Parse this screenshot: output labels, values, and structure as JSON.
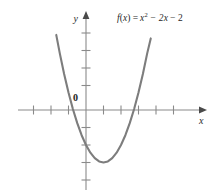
{
  "figure": {
    "title": "",
    "formula": {
      "function_name": "f",
      "argument": "x",
      "equals": "=",
      "term1_base": "x",
      "term1_exp": "2",
      "term2": "− 2x",
      "term3": "− 2",
      "full_text": "f(x) = x2 − 2x − 2"
    },
    "axis_labels": {
      "x": "x",
      "y": "y"
    },
    "origin_label": "0",
    "colors": {
      "curve": "#7d7d7d",
      "axis": "#8a8a8a",
      "text": "#1f1f1f",
      "background": "#ffffff"
    }
  },
  "chart_data": {
    "type": "line",
    "xlabel": "x",
    "ylabel": "y",
    "function": "f(x) = x^2 - 2x - 2",
    "grid": false,
    "legend": "none",
    "xlim": [
      -4.0,
      6.2
    ],
    "ylim": [
      -4.8,
      5.0
    ],
    "xticks": [
      -3,
      -2,
      -1,
      1,
      2,
      3,
      4,
      5
    ],
    "yticks": [
      -4,
      -3,
      -2,
      -1,
      1,
      2,
      3,
      4
    ],
    "tick_labels_shown": [
      "0"
    ],
    "vertex": {
      "x": 1,
      "y": -3
    },
    "y_intercept": {
      "x": 0,
      "y": -2
    },
    "x_intercepts": [
      {
        "x": -0.73,
        "y": 0
      },
      {
        "x": 2.73,
        "y": 0
      }
    ],
    "series": [
      {
        "name": "f(x) = x² − 2x − 2",
        "x": [
          -1.7,
          -1.5,
          -1.25,
          -1.0,
          -0.75,
          -0.5,
          -0.25,
          0.0,
          0.25,
          0.5,
          0.75,
          1.0,
          1.25,
          1.5,
          1.75,
          2.0,
          2.25,
          2.5,
          2.75,
          3.0,
          3.25,
          3.5,
          3.7
        ],
        "values": [
          4.29,
          3.25,
          2.06,
          1.0,
          0.06,
          -0.75,
          -1.44,
          -2.0,
          -2.44,
          -2.75,
          -2.94,
          -3.0,
          -2.94,
          -2.75,
          -2.44,
          -2.0,
          -1.44,
          -0.75,
          0.06,
          1.0,
          2.06,
          3.25,
          4.09
        ]
      }
    ]
  }
}
